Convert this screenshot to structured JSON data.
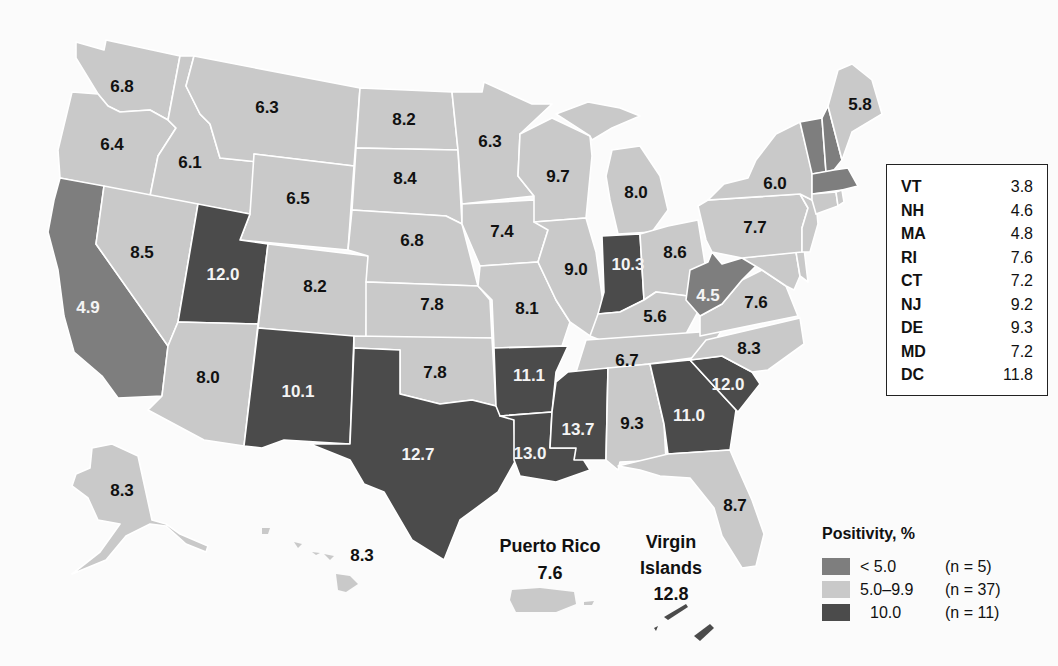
{
  "legend": {
    "title": "Positivity, %",
    "categories": [
      {
        "key": "low",
        "label": "< 5.0",
        "count_label": "(n = 5)",
        "color": "#7e7e7e"
      },
      {
        "key": "mid",
        "label": "5.0–9.9",
        "count_label": "(n = 37)",
        "color": "#c9c9c9"
      },
      {
        "key": "high",
        "label": "10.0",
        "count_label": "(n = 11)",
        "color": "#4b4b4b"
      }
    ]
  },
  "inset_table": {
    "rows": [
      {
        "state": "VT",
        "value": "3.8"
      },
      {
        "state": "NH",
        "value": "4.6"
      },
      {
        "state": "MA",
        "value": "4.8"
      },
      {
        "state": "RI",
        "value": "7.6"
      },
      {
        "state": "CT",
        "value": "7.2"
      },
      {
        "state": "NJ",
        "value": "9.2"
      },
      {
        "state": "DE",
        "value": "9.3"
      },
      {
        "state": "MD",
        "value": "7.2"
      },
      {
        "state": "DC",
        "value": "11.8"
      }
    ]
  },
  "territories": {
    "puerto_rico": {
      "name": "Puerto Rico",
      "value": "7.6"
    },
    "virgin_islands": {
      "name_line1": "Virgin",
      "name_line2": "Islands",
      "value": "12.8"
    }
  },
  "chart_data": {
    "type": "choropleth",
    "title": "Positivity, %",
    "bins": [
      {
        "label": "< 5.0",
        "n": 5
      },
      {
        "label": "5.0–9.9",
        "n": 37
      },
      {
        "label": "≥ 10.0",
        "n": 11
      }
    ],
    "values": {
      "WA": 6.8,
      "OR": 6.4,
      "CA": 4.9,
      "ID": 6.1,
      "NV": 8.5,
      "MT": 6.3,
      "WY": 6.5,
      "UT": 12.0,
      "AZ": 8.0,
      "CO": 8.2,
      "NM": 10.1,
      "ND": 8.2,
      "SD": 8.4,
      "NE": 6.8,
      "KS": 7.8,
      "OK": 7.8,
      "TX": 12.7,
      "MN": 6.3,
      "IA": 7.4,
      "MO": 8.1,
      "AR": 11.1,
      "LA": 13.0,
      "WI": 9.7,
      "IL": 9.0,
      "MI": 8.0,
      "IN": 10.3,
      "OH": 8.6,
      "KY": 5.6,
      "TN": 6.7,
      "MS": 13.7,
      "AL": 9.3,
      "GA": 11.0,
      "FL": 8.7,
      "SC": 12.0,
      "NC": 8.3,
      "VA": 7.6,
      "WV": 4.5,
      "PA": 7.7,
      "NY": 6.0,
      "ME": 5.8,
      "VT": 3.8,
      "NH": 4.6,
      "MA": 4.8,
      "RI": 7.6,
      "CT": 7.2,
      "NJ": 9.2,
      "DE": 9.3,
      "MD": 7.2,
      "DC": 11.8,
      "AK": 8.3,
      "HI": 8.3,
      "PR": 7.6,
      "VI": 12.8
    }
  },
  "map_labels": [
    {
      "st": "WA",
      "v": "6.8",
      "x": 122,
      "y": 88,
      "c": "dark"
    },
    {
      "st": "OR",
      "v": "6.4",
      "x": 112,
      "y": 146,
      "c": "dark"
    },
    {
      "st": "CA",
      "v": "4.9",
      "x": 88,
      "y": 309,
      "c": "light"
    },
    {
      "st": "ID",
      "v": "6.1",
      "x": 190,
      "y": 164,
      "c": "dark"
    },
    {
      "st": "NV",
      "v": "8.5",
      "x": 142,
      "y": 254,
      "c": "dark"
    },
    {
      "st": "MT",
      "v": "6.3",
      "x": 267,
      "y": 109,
      "c": "dark"
    },
    {
      "st": "WY",
      "v": "6.5",
      "x": 298,
      "y": 200,
      "c": "dark"
    },
    {
      "st": "UT",
      "v": "12.0",
      "x": 223,
      "y": 276,
      "c": "light"
    },
    {
      "st": "AZ",
      "v": "8.0",
      "x": 208,
      "y": 379,
      "c": "dark"
    },
    {
      "st": "CO",
      "v": "8.2",
      "x": 315,
      "y": 288,
      "c": "dark"
    },
    {
      "st": "NM",
      "v": "10.1",
      "x": 298,
      "y": 393,
      "c": "light"
    },
    {
      "st": "ND",
      "v": "8.2",
      "x": 404,
      "y": 121,
      "c": "dark"
    },
    {
      "st": "SD",
      "v": "8.4",
      "x": 405,
      "y": 180,
      "c": "dark"
    },
    {
      "st": "NE",
      "v": "6.8",
      "x": 412,
      "y": 242,
      "c": "dark"
    },
    {
      "st": "KS",
      "v": "7.8",
      "x": 432,
      "y": 306,
      "c": "dark"
    },
    {
      "st": "OK",
      "v": "7.8",
      "x": 435,
      "y": 374,
      "c": "dark"
    },
    {
      "st": "TX",
      "v": "12.7",
      "x": 418,
      "y": 456,
      "c": "light"
    },
    {
      "st": "MN",
      "v": "6.3",
      "x": 490,
      "y": 143,
      "c": "dark"
    },
    {
      "st": "IA",
      "v": "7.4",
      "x": 502,
      "y": 233,
      "c": "dark"
    },
    {
      "st": "MO",
      "v": "8.1",
      "x": 527,
      "y": 310,
      "c": "dark"
    },
    {
      "st": "AR",
      "v": "11.1",
      "x": 529,
      "y": 377,
      "c": "light"
    },
    {
      "st": "LA",
      "v": "13.0",
      "x": 530,
      "y": 455,
      "c": "light"
    },
    {
      "st": "WI",
      "v": "9.7",
      "x": 558,
      "y": 178,
      "c": "dark"
    },
    {
      "st": "IL",
      "v": "9.0",
      "x": 576,
      "y": 271,
      "c": "dark"
    },
    {
      "st": "MI",
      "v": "8.0",
      "x": 636,
      "y": 194,
      "c": "dark"
    },
    {
      "st": "IN",
      "v": "10.3",
      "x": 628,
      "y": 266,
      "c": "light"
    },
    {
      "st": "OH",
      "v": "8.6",
      "x": 675,
      "y": 254,
      "c": "dark"
    },
    {
      "st": "KY",
      "v": "5.6",
      "x": 655,
      "y": 318,
      "c": "dark"
    },
    {
      "st": "TN",
      "v": "6.7",
      "x": 627,
      "y": 362,
      "c": "dark"
    },
    {
      "st": "MS",
      "v": "13.7",
      "x": 578,
      "y": 431,
      "c": "light"
    },
    {
      "st": "AL",
      "v": "9.3",
      "x": 632,
      "y": 425,
      "c": "dark"
    },
    {
      "st": "GA",
      "v": "11.0",
      "x": 689,
      "y": 417,
      "c": "light"
    },
    {
      "st": "FL",
      "v": "8.7",
      "x": 735,
      "y": 507,
      "c": "dark"
    },
    {
      "st": "SC",
      "v": "12.0",
      "x": 728,
      "y": 386,
      "c": "light"
    },
    {
      "st": "NC",
      "v": "8.3",
      "x": 749,
      "y": 350,
      "c": "dark"
    },
    {
      "st": "VA",
      "v": "7.6",
      "x": 756,
      "y": 304,
      "c": "dark"
    },
    {
      "st": "WV",
      "v": "4.5",
      "x": 708,
      "y": 297,
      "c": "light"
    },
    {
      "st": "PA",
      "v": "7.7",
      "x": 755,
      "y": 229,
      "c": "dark"
    },
    {
      "st": "NY",
      "v": "6.0",
      "x": 775,
      "y": 185,
      "c": "dark"
    },
    {
      "st": "ME",
      "v": "5.8",
      "x": 860,
      "y": 106,
      "c": "dark"
    },
    {
      "st": "AK",
      "v": "8.3",
      "x": 122,
      "y": 492,
      "c": "dark"
    },
    {
      "st": "HI",
      "v": "8.3",
      "x": 362,
      "y": 557,
      "c": "dark"
    }
  ]
}
